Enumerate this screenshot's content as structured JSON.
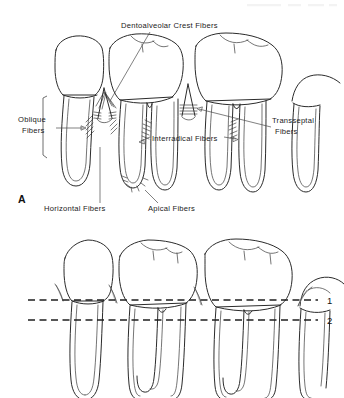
{
  "figure": {
    "background_color": "#ffffff",
    "ink_color": "#2b2b2b",
    "width": 344,
    "height": 398
  },
  "panel_a": {
    "letter": "A",
    "letter_x": 18,
    "letter_y": 203,
    "labels": [
      {
        "id": "dentoalveolar-crest-fibers",
        "text": "Dentoalveolar Crest Fibers",
        "x": 121,
        "y": 28,
        "anchor": "start",
        "leader": "M 150 32 L 110 101"
      },
      {
        "id": "oblique-fibers",
        "text": "Oblique",
        "text2": "Fibers",
        "x": 18,
        "y": 122,
        "anchor": "start",
        "leader": "M 56 128 L 84 128",
        "arrow": "M 84 128 l -5 -2.2 l 0 4.4 z"
      },
      {
        "id": "transseptal-fibers",
        "text": "Transseptal",
        "text2": "Fibers",
        "x": 272,
        "y": 123,
        "anchor": "start",
        "leader": "M 271 127 L 216 108",
        "arrow": "M 216 108 l 5.2 -1.3 l -1.4 4.3 z"
      },
      {
        "id": "interradical-fibers",
        "text": "Interradical  Fibers",
        "x": 152,
        "y": 141,
        "anchor": "start",
        "leader_left": "M 151 138 L 142 143",
        "arrow_left": "M 142 143 l 4.6 -2.2 l 0.6 4.4 z",
        "leader_right": "M 226 138 L 238 140",
        "arrow_right": "M 240 140 l -5 -2.2 l 0 4.4 z"
      },
      {
        "id": "horizontal-fibers",
        "text": "Horizontal  Fibers",
        "x": 44,
        "y": 211,
        "anchor": "start",
        "leader": "M 100 204 L 100 146"
      },
      {
        "id": "apical-fibers",
        "text": "Apical Fibers",
        "x": 148,
        "y": 211,
        "anchor": "start",
        "leader": "M 156 204 L 146 192"
      }
    ]
  },
  "panel_b": {
    "reference_lines": [
      {
        "id": "line-1",
        "number": "1",
        "y": 300,
        "x_start": 28,
        "x_end": 318,
        "label_x": 327
      },
      {
        "id": "line-2",
        "number": "2",
        "y": 320,
        "x_start": 28,
        "x_end": 318,
        "label_x": 327
      }
    ]
  }
}
